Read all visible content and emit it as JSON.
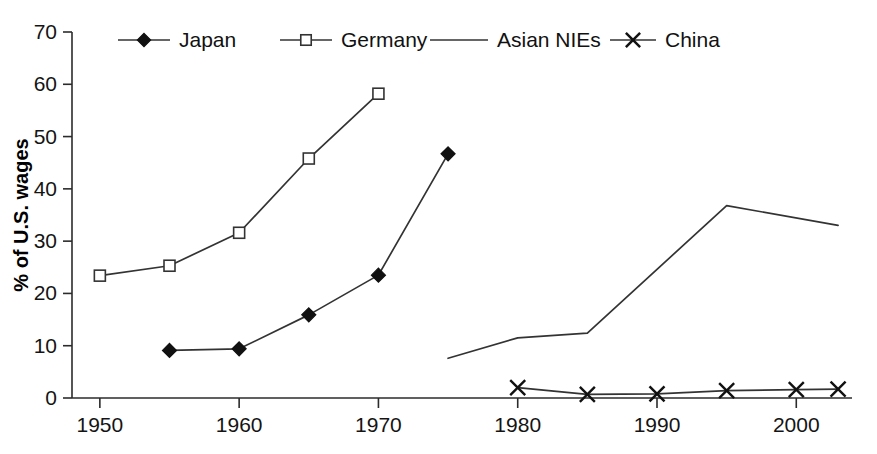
{
  "chart_data": {
    "type": "line",
    "title": "",
    "xlabel": "",
    "ylabel": "% of U.S. wages",
    "xlim": [
      1948,
      2004
    ],
    "ylim": [
      0,
      70
    ],
    "yticks": [
      0,
      10,
      20,
      30,
      40,
      50,
      60,
      70
    ],
    "ytick_labels": [
      "0",
      "10",
      "20",
      "30",
      "40",
      "50",
      "60",
      "70"
    ],
    "xticks": [
      1950,
      1960,
      1970,
      1980,
      1990,
      2000
    ],
    "xtick_labels": [
      "1950",
      "1960",
      "1970",
      "1980",
      "1990",
      "2000"
    ],
    "grid": false,
    "legend_position": "top",
    "series": [
      {
        "name": "Japan",
        "marker": "filled-diamond",
        "color": "#111111",
        "x": [
          1955,
          1960,
          1965,
          1970,
          1975
        ],
        "values": [
          9.1,
          9.4,
          15.9,
          23.5,
          46.7
        ]
      },
      {
        "name": "Germany",
        "marker": "open-square",
        "color": "#333333",
        "x": [
          1950,
          1955,
          1960,
          1965,
          1970
        ],
        "values": [
          23.4,
          25.3,
          31.6,
          45.8,
          58.2
        ]
      },
      {
        "name": "Asian NIEs",
        "marker": "none",
        "color": "#333333",
        "x": [
          1975,
          1980,
          1985,
          1995,
          2003
        ],
        "values": [
          7.6,
          11.5,
          12.4,
          36.8,
          33.0
        ]
      },
      {
        "name": "China",
        "marker": "cross",
        "color": "#111111",
        "x": [
          1980,
          1985,
          1990,
          1995,
          2000,
          2003
        ],
        "values": [
          2.0,
          0.7,
          0.8,
          1.4,
          1.6,
          1.7
        ]
      }
    ]
  },
  "legend": {
    "entries": [
      {
        "label": "Japan",
        "marker": "filled-diamond"
      },
      {
        "label": "Germany",
        "marker": "open-square"
      },
      {
        "label": "Asian NIEs",
        "marker": "none"
      },
      {
        "label": "China",
        "marker": "cross"
      }
    ]
  }
}
